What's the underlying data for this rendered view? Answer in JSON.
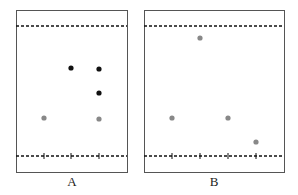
{
  "panels": [
    {
      "label": "A",
      "box": {
        "x": 16,
        "y": 10,
        "w": 111,
        "h": 162
      },
      "top_line_y": 26,
      "bottom_line_y": 156,
      "ticks_x": [
        44,
        71,
        99
      ],
      "points": [
        {
          "x": 71,
          "y": 68,
          "color": "#111111"
        },
        {
          "x": 99,
          "y": 69,
          "color": "#111111"
        },
        {
          "x": 99,
          "y": 93,
          "color": "#111111"
        },
        {
          "x": 44,
          "y": 118,
          "color": "#888888"
        },
        {
          "x": 99,
          "y": 119,
          "color": "#888888"
        }
      ]
    },
    {
      "label": "B",
      "box": {
        "x": 144,
        "y": 10,
        "w": 140,
        "h": 162
      },
      "top_line_y": 26,
      "bottom_line_y": 156,
      "ticks_x": [
        172,
        200,
        228,
        256
      ],
      "points": [
        {
          "x": 200,
          "y": 38,
          "color": "#888888"
        },
        {
          "x": 172,
          "y": 118,
          "color": "#888888"
        },
        {
          "x": 228,
          "y": 118,
          "color": "#888888"
        },
        {
          "x": 256,
          "y": 142,
          "color": "#888888"
        }
      ]
    }
  ]
}
